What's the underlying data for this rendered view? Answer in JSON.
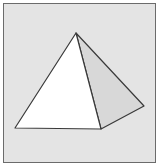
{
  "figure": {
    "colors": {
      "background": "#e4e4e4",
      "frame_border": "#6b6b6b",
      "front_face": "#ffffff",
      "side_face": "#d8d8d8",
      "edge": "#3a3a3a"
    },
    "faces": [
      {
        "name": "front-face",
        "fill_key": "front_face"
      },
      {
        "name": "side-face",
        "fill_key": "side_face"
      }
    ]
  }
}
